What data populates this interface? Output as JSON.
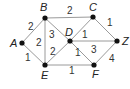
{
  "graph": {
    "nodes": [
      {
        "id": "A",
        "label": "A",
        "x": 22,
        "y": 43,
        "lx": 10,
        "ly": 47
      },
      {
        "id": "B",
        "label": "B",
        "x": 45,
        "y": 18,
        "lx": 40,
        "ly": 11
      },
      {
        "id": "C",
        "label": "C",
        "x": 93,
        "y": 17,
        "lx": 89,
        "ly": 11
      },
      {
        "id": "D",
        "label": "D",
        "x": 70,
        "y": 41,
        "lx": 65,
        "ly": 36
      },
      {
        "id": "E",
        "label": "E",
        "x": 45,
        "y": 65,
        "lx": 41,
        "ly": 79
      },
      {
        "id": "F",
        "label": "F",
        "x": 94,
        "y": 65,
        "lx": 92,
        "ly": 78
      },
      {
        "id": "Z",
        "label": "Z",
        "x": 117,
        "y": 41,
        "lx": 122,
        "ly": 45
      }
    ],
    "edges": [
      {
        "from": "A",
        "to": "B",
        "weight": "2",
        "wx": 28,
        "wy": 30
      },
      {
        "from": "A",
        "to": "E",
        "weight": "1",
        "wx": 25,
        "wy": 61
      },
      {
        "from": "B",
        "to": "E",
        "weight": "2",
        "wx": 36,
        "wy": 46
      },
      {
        "from": "B",
        "to": "D",
        "weight": "3",
        "wx": 49,
        "wy": 38
      },
      {
        "from": "E",
        "to": "D",
        "weight": "2",
        "wx": 50,
        "wy": 55
      },
      {
        "from": "B",
        "to": "C",
        "weight": "2",
        "wx": 67,
        "wy": 14
      },
      {
        "from": "C",
        "to": "D",
        "weight": "1",
        "wx": 82,
        "wy": 38
      },
      {
        "from": "C",
        "to": "Z",
        "weight": "1",
        "wx": 107,
        "wy": 26
      },
      {
        "from": "D",
        "to": "Z",
        "weight": "3",
        "wx": 91,
        "wy": 53
      },
      {
        "from": "D",
        "to": "F",
        "weight": "1",
        "wx": 75,
        "wy": 56
      },
      {
        "from": "E",
        "to": "F",
        "weight": "1",
        "wx": 69,
        "wy": 74
      },
      {
        "from": "F",
        "to": "Z",
        "weight": "4",
        "wx": 109,
        "wy": 62
      }
    ]
  }
}
